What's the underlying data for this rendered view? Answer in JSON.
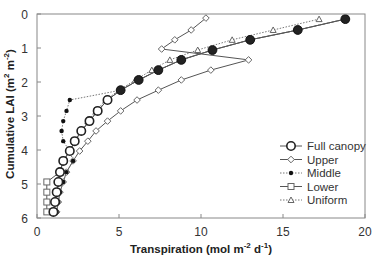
{
  "chart_data": {
    "type": "line",
    "title": "",
    "xlabel": "Transpiration (mol m-2 d-1)",
    "xlabel_parts": {
      "main": "Transpiration (mol m",
      "sup1": "-2",
      "mid": " d",
      "sup2": "-1",
      "end": ")"
    },
    "ylabel": "Cumulative LAI (m2 m-2)",
    "ylabel_parts": {
      "main": "Cumulative LAI (m",
      "sup1": "2",
      "mid": " m",
      "sup2": "-2",
      "end": ")"
    },
    "xlim": [
      0,
      20
    ],
    "ylim": [
      0,
      6
    ],
    "y_inverted": true,
    "x_ticks": [
      "0",
      "5",
      "10",
      "15",
      "20"
    ],
    "y_ticks": [
      "0",
      "1",
      "2",
      "3",
      "4",
      "5",
      "6"
    ],
    "grid": false,
    "legend_position": "lower right inside",
    "series": [
      {
        "name": "Full canopy",
        "marker": "open-circle",
        "line": "solid",
        "points": [
          [
            18.8,
            0.15
          ],
          [
            15.9,
            0.47
          ],
          [
            13.0,
            0.76
          ],
          [
            10.7,
            1.06
          ],
          [
            8.8,
            1.35
          ],
          [
            7.4,
            1.65
          ],
          [
            6.2,
            1.94
          ],
          [
            5.1,
            2.24
          ],
          [
            4.3,
            2.53
          ],
          [
            3.7,
            2.85
          ],
          [
            3.2,
            3.15
          ],
          [
            2.7,
            3.44
          ],
          [
            2.3,
            3.74
          ],
          [
            2.0,
            4.03
          ],
          [
            1.6,
            4.32
          ],
          [
            1.4,
            4.65
          ],
          [
            1.3,
            4.94
          ],
          [
            1.2,
            5.24
          ],
          [
            1.1,
            5.53
          ],
          [
            1.0,
            5.82
          ]
        ]
      },
      {
        "name": "Upper",
        "marker": "diamond",
        "line": "solid",
        "points": [
          [
            10.3,
            0.12
          ],
          [
            9.4,
            0.47
          ],
          [
            8.4,
            0.76
          ],
          [
            7.6,
            1.03
          ],
          [
            12.9,
            1.35
          ],
          [
            10.6,
            1.65
          ],
          [
            8.8,
            1.94
          ],
          [
            7.4,
            2.24
          ],
          [
            6.1,
            2.53
          ],
          [
            5.1,
            2.85
          ],
          [
            4.3,
            3.15
          ],
          [
            3.6,
            3.44
          ],
          [
            3.1,
            3.74
          ],
          [
            2.6,
            4.03
          ],
          [
            2.2,
            4.32
          ],
          [
            1.8,
            4.65
          ],
          [
            1.6,
            4.94
          ],
          [
            1.4,
            5.24
          ],
          [
            1.3,
            5.53
          ],
          [
            1.2,
            5.82
          ]
        ]
      },
      {
        "name": "Middle",
        "marker": "filled-circle-small",
        "line": "dotted",
        "points": [
          [
            18.8,
            0.15
          ],
          [
            15.9,
            0.47
          ],
          [
            13.0,
            0.76
          ],
          [
            10.7,
            1.06
          ],
          [
            8.8,
            1.35
          ],
          [
            7.4,
            1.65
          ],
          [
            6.2,
            1.94
          ],
          [
            5.1,
            2.24
          ],
          [
            2.0,
            2.53
          ],
          [
            1.8,
            2.85
          ],
          [
            1.6,
            3.15
          ],
          [
            1.5,
            3.44
          ],
          [
            1.6,
            3.74
          ],
          [
            2.0,
            4.03
          ],
          [
            2.2,
            4.32
          ],
          [
            1.8,
            4.65
          ],
          [
            1.6,
            4.94
          ],
          [
            1.4,
            5.24
          ],
          [
            1.3,
            5.53
          ],
          [
            1.2,
            5.82
          ]
        ]
      },
      {
        "name": "Lower",
        "marker": "open-square",
        "line": "solid",
        "points": [
          [
            18.8,
            0.15
          ],
          [
            15.9,
            0.47
          ],
          [
            13.0,
            0.76
          ],
          [
            10.7,
            1.06
          ],
          [
            8.8,
            1.35
          ],
          [
            7.4,
            1.65
          ],
          [
            6.2,
            1.94
          ],
          [
            5.1,
            2.24
          ],
          [
            4.3,
            2.53
          ],
          [
            3.7,
            2.85
          ],
          [
            3.2,
            3.15
          ],
          [
            2.7,
            3.44
          ],
          [
            2.3,
            3.74
          ],
          [
            2.0,
            4.03
          ],
          [
            1.6,
            4.32
          ],
          [
            1.4,
            4.65
          ],
          [
            0.6,
            4.94
          ],
          [
            0.6,
            5.24
          ],
          [
            0.6,
            5.53
          ],
          [
            0.6,
            5.82
          ]
        ]
      },
      {
        "name": "Uniform",
        "marker": "triangle",
        "line": "dotted",
        "points": [
          [
            17.2,
            0.15
          ],
          [
            14.4,
            0.47
          ],
          [
            11.9,
            0.76
          ],
          [
            9.8,
            1.06
          ],
          [
            8.1,
            1.35
          ],
          [
            7.0,
            1.65
          ],
          [
            6.0,
            1.94
          ],
          [
            5.0,
            2.24
          ],
          [
            4.2,
            2.53
          ],
          [
            3.6,
            2.85
          ],
          [
            3.1,
            3.15
          ],
          [
            2.7,
            3.44
          ],
          [
            2.3,
            3.74
          ],
          [
            2.0,
            4.03
          ],
          [
            1.6,
            4.32
          ],
          [
            1.4,
            4.65
          ],
          [
            1.3,
            4.94
          ],
          [
            1.2,
            5.24
          ],
          [
            1.1,
            5.53
          ],
          [
            1.0,
            5.82
          ]
        ]
      }
    ]
  },
  "colors": {
    "axis": "#888888",
    "line": "#555555",
    "marker_fill_dark": "#222222",
    "marker_fill_open": "#ffffff",
    "text": "#333333"
  }
}
